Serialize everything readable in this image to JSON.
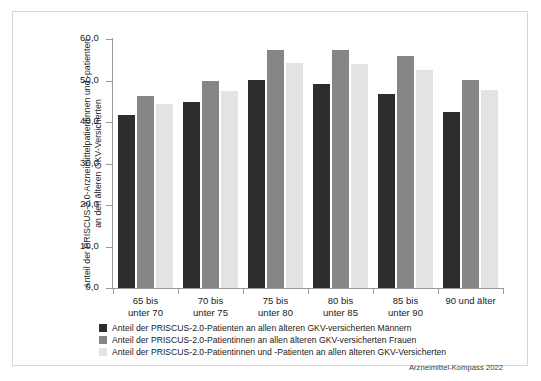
{
  "chart_data": {
    "type": "bar",
    "title": "",
    "subtitle": "",
    "xlabel": "",
    "ylabel": "Anteil der PRISCUS-2.0-Arzneimittelpatientinnen und -patienten an den älteren GKV-Versicherten",
    "ylim": [
      0,
      60
    ],
    "ytick_labels": [
      "0,0",
      "10,0",
      "20,0",
      "30,0",
      "40,0",
      "50,0",
      "60,0"
    ],
    "ytick_values": [
      0,
      10,
      20,
      30,
      40,
      50,
      60
    ],
    "grid": false,
    "legend_position": "bottom-left",
    "categories": [
      "65 bis\nunter 70",
      "70 bis\nunter 75",
      "75 bis\nunter 80",
      "80 bis\nunter 85",
      "85 bis\nunter 90",
      "90 und älter"
    ],
    "series": [
      {
        "name": "Anteil der PRISCUS-2.0-Patienten an allen älteren GKV-versicherten Männern",
        "color": "#2d2d2d",
        "values": [
          41.8,
          44.8,
          50.1,
          49.2,
          46.8,
          42.3
        ]
      },
      {
        "name": "Anteil der PRISCUS-2.0-Patientinnen an allen älteren GKV-versicherten Frauen",
        "color": "#868686",
        "values": [
          46.3,
          49.8,
          57.3,
          57.3,
          55.9,
          50.1
        ]
      },
      {
        "name": "Anteil der PRISCUS-2.0-Patientinnen und -Patienten an allen älteren GKV-Versicherten",
        "color": "#e3e3e3",
        "values": [
          44.3,
          47.5,
          54.3,
          54.0,
          52.6,
          47.8
        ]
      }
    ],
    "source": "Arzneimittel-Kompass 2022"
  }
}
